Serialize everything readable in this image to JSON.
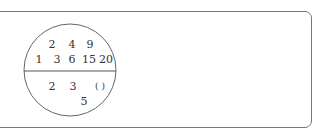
{
  "diagram": {
    "type": "divided-circle",
    "top_section": {
      "row1": [
        "2",
        "4",
        "9"
      ],
      "row2": [
        "1",
        "3",
        "6",
        "15",
        "20"
      ]
    },
    "bottom_section": {
      "row1": [
        "2",
        "3",
        "(  )"
      ],
      "row2": [
        "5"
      ]
    }
  }
}
